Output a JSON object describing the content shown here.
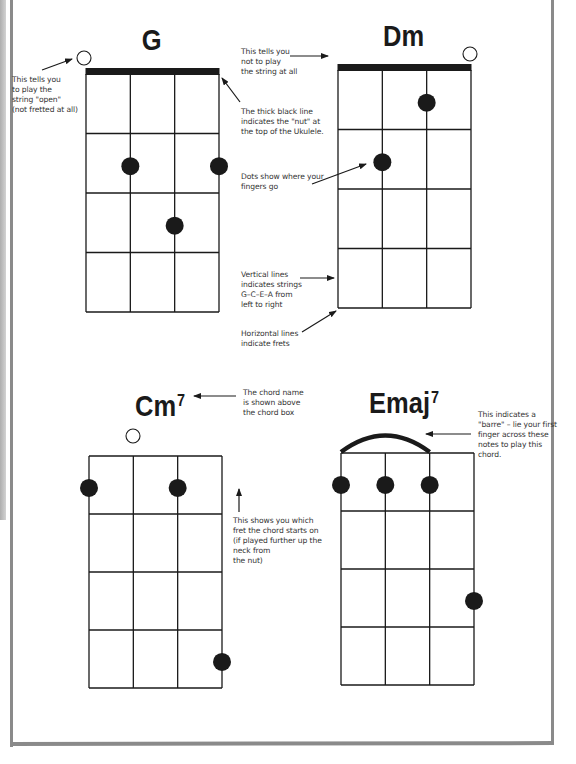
{
  "page": {
    "truncated_header": "",
    "frame_color": "#8a8a8a",
    "ink_color": "#1a1a1a"
  },
  "chord_data": {
    "strings_left_to_right": [
      "G",
      "C",
      "E",
      "A"
    ],
    "chords": [
      {
        "name": "G",
        "sup": "",
        "title_pos": [
          152,
          36
        ],
        "box": {
          "x": 86,
          "y": 74,
          "w": 133,
          "h": 238,
          "frets": 4
        },
        "nut": true,
        "open_strings": [
          0
        ],
        "open_marker_pos": [
          [
            84,
            58
          ]
        ],
        "barre": null,
        "dots": [
          {
            "string": 1,
            "fret": 2
          },
          {
            "string": 3,
            "fret": 2
          },
          {
            "string": 2,
            "fret": 3
          }
        ]
      },
      {
        "name": "Dm",
        "sup": "",
        "title_pos": [
          404,
          32
        ],
        "box": {
          "x": 338,
          "y": 70,
          "w": 133,
          "h": 238,
          "frets": 4
        },
        "nut": true,
        "open_strings": [
          3
        ],
        "open_marker_pos": [
          [
            470,
            54
          ]
        ],
        "barre": null,
        "dots": [
          {
            "string": 2,
            "fret": 1
          },
          {
            "string": 1,
            "fret": 2
          }
        ]
      },
      {
        "name": "Cm",
        "sup": "7",
        "title_pos": [
          160,
          400
        ],
        "box": {
          "x": 89,
          "y": 456,
          "w": 133,
          "h": 232,
          "frets": 4
        },
        "nut": false,
        "open_strings": [
          1
        ],
        "open_marker_pos": [
          [
            133,
            436
          ]
        ],
        "barre": null,
        "dots": [
          {
            "string": 0,
            "fret": 1
          },
          {
            "string": 2,
            "fret": 1
          },
          {
            "string": 3,
            "fret": 4
          }
        ]
      },
      {
        "name": "Emaj",
        "sup": "7",
        "title_pos": [
          404,
          397
        ],
        "box": {
          "x": 341,
          "y": 453,
          "w": 133,
          "h": 232,
          "frets": 4
        },
        "nut": false,
        "open_strings": [],
        "open_marker_pos": [],
        "barre": {
          "from_string": 0,
          "to_string": 2,
          "fret": 1,
          "peak_y": 435
        },
        "dots": [
          {
            "string": 0,
            "fret": 1
          },
          {
            "string": 1,
            "fret": 1
          },
          {
            "string": 2,
            "fret": 1
          },
          {
            "string": 3,
            "fret": 3
          }
        ]
      }
    ]
  },
  "annotations": {
    "open_string": "This tells you\nto play the\nstring \"open\"\n(not fretted at all)",
    "not_play": "This tells you\nnot to play\nthe string at all",
    "nut": "The thick black line\nindicates the \"nut\" at\nthe top of the Ukulele.",
    "dots": "Dots show where your\nfingers go",
    "vertical_lines": "Vertical lines\nindicates strings\nG–C–E–A from\nleft to right",
    "horizontal_lines": "Horizontal lines\nindicate frets",
    "chord_name": "The chord name\nis shown above\nthe chord box",
    "start_fret": "This shows you which\nfret the chord starts on\n(if played further up the\nneck from\nthe nut)",
    "barre": "This indicates a\n\"barre\" – lie your first\nfinger across these\nnotes to play this\nchord."
  },
  "arrows": [
    {
      "name": "arrow-open-string",
      "from": [
        42,
        70
      ],
      "to": [
        72,
        59
      ]
    },
    {
      "name": "arrow-not-play",
      "from": [
        290,
        56
      ],
      "to": [
        328,
        56
      ]
    },
    {
      "name": "arrow-nut",
      "from": [
        240,
        102
      ],
      "to": [
        222,
        78
      ]
    },
    {
      "name": "arrow-dots",
      "from": [
        312,
        184
      ],
      "to": [
        366,
        164
      ]
    },
    {
      "name": "arrow-vertical-lines",
      "from": [
        300,
        278
      ],
      "to": [
        334,
        278
      ]
    },
    {
      "name": "arrow-horizontal-lines",
      "from": [
        302,
        332
      ],
      "to": [
        336,
        311
      ]
    },
    {
      "name": "arrow-chord-name",
      "from": [
        236,
        396
      ],
      "to": [
        194,
        396
      ]
    },
    {
      "name": "arrow-start-fret",
      "from": [
        239,
        512
      ],
      "to": [
        239,
        489
      ]
    },
    {
      "name": "arrow-barre",
      "from": [
        471,
        434
      ],
      "to": [
        426,
        434
      ]
    }
  ]
}
